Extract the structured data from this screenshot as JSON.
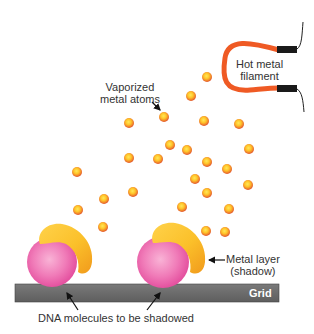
{
  "diagram": {
    "labels": {
      "filament": [
        "Hot metal",
        "filament"
      ],
      "atoms": [
        "Vaporized",
        "metal atoms"
      ],
      "metal_layer": [
        "Metal layer",
        "(shadow)"
      ],
      "grid": "Grid",
      "dna": "DNA molecules to be shadowed"
    },
    "colors": {
      "filament": "#ef5a24",
      "connector": "#1a1a1a",
      "atom_outer": "#e8582a",
      "atom_inner": "#ffd23a",
      "sphere": "#ee5aa8",
      "sphere_highlight": "#f9b3d6",
      "shadow_layer": "#f6b420",
      "shadow_highlight": "#ffe27a",
      "grid": "#6b6b6b"
    },
    "atoms": [
      [
        207,
        77
      ],
      [
        191,
        96
      ],
      [
        164,
        117
      ],
      [
        129,
        123
      ],
      [
        204,
        121
      ],
      [
        239,
        124
      ],
      [
        170,
        145
      ],
      [
        187,
        150
      ],
      [
        249,
        149
      ],
      [
        129,
        158
      ],
      [
        158,
        159
      ],
      [
        207,
        162
      ],
      [
        227,
        169
      ],
      [
        77,
        172
      ],
      [
        195,
        179
      ],
      [
        248,
        185
      ],
      [
        133,
        192
      ],
      [
        104,
        199
      ],
      [
        207,
        193
      ],
      [
        78,
        210
      ],
      [
        182,
        207
      ],
      [
        229,
        209
      ],
      [
        103,
        227
      ],
      [
        206,
        231
      ],
      [
        225,
        232
      ]
    ],
    "molecules": [
      {
        "cx": 52,
        "cy": 262,
        "r": 25
      },
      {
        "cx": 163,
        "cy": 262,
        "r": 26
      }
    ]
  }
}
